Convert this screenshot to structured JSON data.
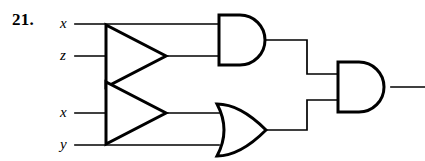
{
  "figure": {
    "problem_number": "21.",
    "type": "logic-circuit-diagram",
    "ink_color": "#000000",
    "background_color": "#ffffff"
  },
  "inputs": [
    {
      "id": "x-top",
      "label": "x",
      "wire_y": 24
    },
    {
      "id": "z",
      "label": "z",
      "wire_y": 56
    },
    {
      "id": "x-bot",
      "label": "x",
      "wire_y": 113
    },
    {
      "id": "y",
      "label": "y",
      "wire_y": 145
    }
  ],
  "gates": [
    {
      "id": "buffer-top",
      "type": "buffer-triangle",
      "name": "inverter-buffer-top"
    },
    {
      "id": "buffer-bot",
      "type": "buffer-triangle",
      "name": "inverter-buffer-bottom"
    },
    {
      "id": "and-top",
      "type": "and",
      "name": "and-gate-top"
    },
    {
      "id": "or-bottom",
      "type": "or",
      "name": "or-gate-bottom"
    },
    {
      "id": "and-output",
      "type": "and",
      "name": "and-gate-output"
    }
  ],
  "output": {
    "id": "circuit-output",
    "wire_y": 87
  }
}
